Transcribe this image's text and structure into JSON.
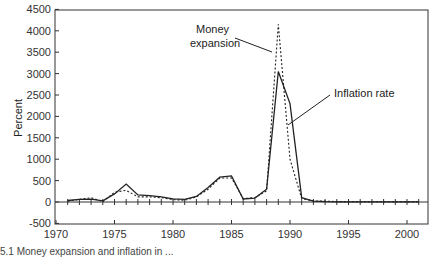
{
  "chart_data": {
    "type": "line",
    "title": "",
    "xlabel": "",
    "ylabel": "Percent",
    "xlim": [
      1970,
      2002.5
    ],
    "ylim": [
      -500,
      4500
    ],
    "x_ticks": [
      1970,
      1975,
      1980,
      1985,
      1990,
      1995,
      2000
    ],
    "y_ticks": [
      -500,
      0,
      500,
      1000,
      1500,
      2000,
      2500,
      3000,
      3500,
      4000,
      4500
    ],
    "grid": false,
    "legend": "inline annotations",
    "x": [
      1971,
      1972,
      1973,
      1974,
      1975,
      1976,
      1977,
      1978,
      1979,
      1980,
      1981,
      1982,
      1983,
      1984,
      1985,
      1986,
      1987,
      1988,
      1989,
      1990,
      1991,
      1992,
      1993,
      1994,
      1995,
      1996,
      1997,
      1998,
      1999,
      2000,
      2001
    ],
    "series": [
      {
        "name": "Inflation rate",
        "style": "solid",
        "values": [
          35,
          60,
          65,
          25,
          190,
          420,
          165,
          150,
          120,
          75,
          60,
          130,
          340,
          580,
          610,
          70,
          90,
          300,
          3050,
          2300,
          100,
          20,
          10,
          5,
          5,
          3,
          5,
          5,
          4,
          3,
          3
        ]
      },
      {
        "name": "Money expansion",
        "style": "dotted",
        "values": [
          20,
          60,
          100,
          10,
          230,
          270,
          120,
          120,
          100,
          55,
          40,
          120,
          300,
          560,
          560,
          80,
          100,
          260,
          4150,
          1000,
          80,
          25,
          20,
          10,
          8,
          5,
          8,
          6,
          5,
          4,
          4
        ]
      }
    ],
    "annotations": [
      {
        "text": "Money\nexpansion",
        "points_to": "Money expansion, 1989 peak"
      },
      {
        "text": "Inflation rate",
        "points_to": "Inflation rate, 1990"
      }
    ]
  },
  "labels": {
    "ylabel": "Percent",
    "money_line1": "Money",
    "money_line2": "expansion",
    "inflation": "Inflation rate",
    "caption": "5.1 Money expansion and inflation in ..."
  }
}
